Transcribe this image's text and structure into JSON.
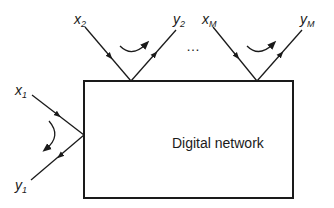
{
  "diagram": {
    "box": {
      "label": "Digital network",
      "x": 84,
      "y": 81,
      "width": 209,
      "height": 117
    },
    "ports": [
      {
        "id": "port-1",
        "input": {
          "base": "x",
          "sub": "1"
        },
        "output": {
          "base": "y",
          "sub": "1"
        },
        "side": "left"
      },
      {
        "id": "port-2",
        "input": {
          "base": "x",
          "sub": "2"
        },
        "output": {
          "base": "y",
          "sub": "2"
        },
        "side": "top"
      },
      {
        "id": "port-M",
        "input": {
          "base": "x",
          "sub": "M"
        },
        "output": {
          "base": "y",
          "sub": "M"
        },
        "side": "top"
      }
    ],
    "ellipsis": "…",
    "colors": {
      "stroke": "#1a1a1a",
      "background": "#ffffff"
    }
  }
}
